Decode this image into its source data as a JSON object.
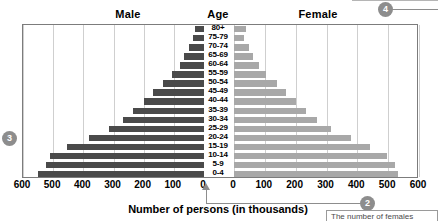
{
  "headers": {
    "male": "Male",
    "age": "Age",
    "female": "Female"
  },
  "axis_title": "Number of persons (in thousands)",
  "note": {
    "text": "The number of females"
  },
  "markers": {
    "m2": "2",
    "m3": "3",
    "m4": "4"
  },
  "colors": {
    "male_bar": "#4a4a4a",
    "female_bar": "#a8a8a8",
    "gridline": "#cfcfcf",
    "frame": "#7c7c7c",
    "marker": "#8d8d8d"
  },
  "chart_data": {
    "type": "bar",
    "xlabel": "Number of persons (in thousands)",
    "ylabel": "Age",
    "orientation": "horizontal",
    "layout": "population-pyramid",
    "grid": true,
    "legend_position": "top",
    "xlim_male": [
      0,
      600
    ],
    "xlim_female": [
      0,
      600
    ],
    "tick_step": 100,
    "male_ticks": [
      "600",
      "500",
      "400",
      "300",
      "200",
      "100",
      "0"
    ],
    "female_ticks": [
      "0",
      "100",
      "200",
      "300",
      "400",
      "500",
      "600"
    ],
    "categories": [
      "80+",
      "75-79",
      "70-74",
      "65-69",
      "60-64",
      "55-59",
      "50-54",
      "45-49",
      "40-44",
      "35-39",
      "30-34",
      "25-29",
      "20-24",
      "15-19",
      "10-14",
      "5-9",
      "0-4"
    ],
    "series": [
      {
        "name": "Male",
        "color": "#4a4a4a",
        "values": [
          30,
          35,
          50,
          65,
          80,
          105,
          135,
          170,
          200,
          235,
          270,
          315,
          380,
          455,
          510,
          525,
          550
        ]
      },
      {
        "name": "Female",
        "color": "#a8a8a8",
        "values": [
          38,
          32,
          48,
          62,
          80,
          105,
          138,
          170,
          200,
          235,
          268,
          315,
          378,
          442,
          497,
          522,
          532
        ]
      }
    ]
  }
}
